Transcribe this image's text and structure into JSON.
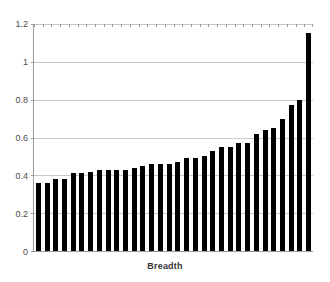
{
  "chart_data": {
    "type": "bar",
    "title": "",
    "subtitle": "",
    "xlabel": "Breadth",
    "ylabel": "",
    "grid": true,
    "legend": false,
    "legend_position": "none",
    "ylim": [
      0,
      1.2
    ],
    "yticks": [
      0,
      0.2,
      0.4,
      0.6,
      0.8,
      1,
      1.2
    ],
    "ytick_labels": [
      "0",
      "0.2",
      "0.4",
      "0.6",
      "0.8",
      "1",
      "1.2"
    ],
    "xtick_labels": [],
    "bar_color": "#000000",
    "gridline_color": "#c9c9c9",
    "axis_color": "#9a9a9a",
    "background_color": "#ffffff",
    "categories": [
      "1",
      "2",
      "3",
      "4",
      "5",
      "6",
      "7",
      "8",
      "9",
      "10",
      "11",
      "12",
      "13",
      "14",
      "15",
      "16",
      "17",
      "18",
      "19",
      "20",
      "21",
      "22",
      "23",
      "24",
      "25",
      "26",
      "27",
      "28",
      "29",
      "30",
      "31",
      "32"
    ],
    "values": [
      0.36,
      0.36,
      0.38,
      0.38,
      0.41,
      0.42,
      0.43,
      0.43,
      0.43,
      0.44,
      0.45,
      0.46,
      0.46,
      0.46,
      0.47,
      0.49,
      0.5,
      0.53,
      0.55,
      0.57,
      0.57,
      0.62,
      0.64,
      0.65,
      0.7,
      0.77,
      0.8,
      1.15,
      0.41,
      0.43,
      0.49,
      0.55
    ],
    "values_sorted_ascending": true,
    "n_bars": 32,
    "max_value": 1.15,
    "min_value": 0.36
  },
  "axis": {
    "y_label_0": "0",
    "y_label_1": "0.2",
    "y_label_2": "0.4",
    "y_label_3": "0.6",
    "y_label_4": "0.8",
    "y_label_5": "1",
    "y_label_6": "1.2"
  },
  "labels": {
    "x_axis_title": "Breadth"
  }
}
